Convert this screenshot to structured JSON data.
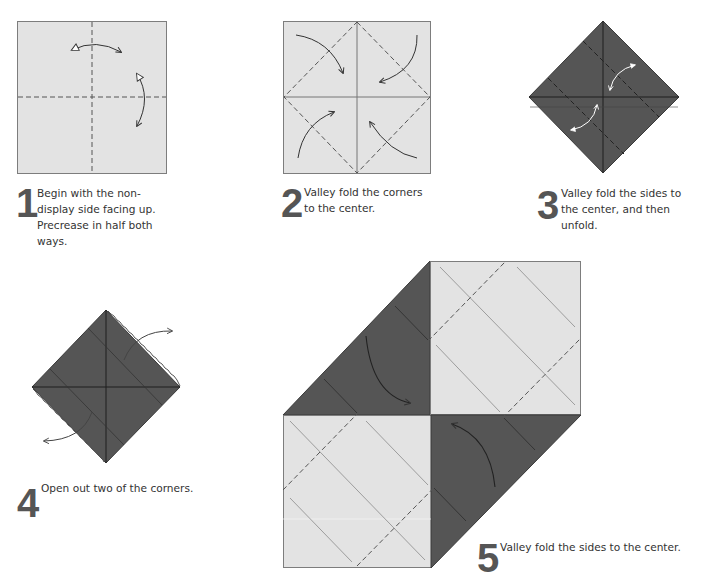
{
  "colors": {
    "paper_light": "#e3e3e3",
    "paper_dark": "#555555",
    "edge": "#7d7d7d",
    "arrow": "#333333",
    "numeral": "#555555"
  },
  "steps": [
    {
      "number": "1",
      "text": "Begin with the non-\ndisplay side facing up.\nPrecrease in half both\nways.",
      "action": "precrease"
    },
    {
      "number": "2",
      "text": "Valley fold the corners\nto the center.",
      "action": "valley-fold-corners"
    },
    {
      "number": "3",
      "text": "Valley fold the sides to\nthe center, and then\nunfold.",
      "action": "valley-fold-sides-unfold"
    },
    {
      "number": "4",
      "text": "Open out two of the corners.",
      "action": "open-corners"
    },
    {
      "number": "5",
      "text": "Valley fold the sides to the center.",
      "action": "valley-fold-sides"
    }
  ],
  "icons": {
    "fold_arrow": "curved-arrow-icon",
    "valley_line": "dashed-line",
    "crease_line": "solid-line"
  }
}
